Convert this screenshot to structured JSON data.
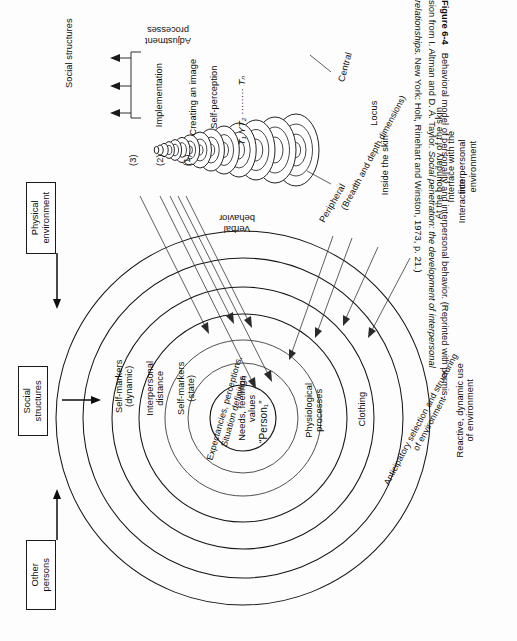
{
  "figure": {
    "number": "Figure 6-4",
    "caption_lines": [
      "Behavioral model of personality and interpersonal behavior. (Reprinted with permis-",
      "sion from I. Altman and D. A. Taylor. Social penetration: the development of interpersonal",
      "relationships. New York: Holt, Rinehart and Winston, 1973, p. 21.)"
    ],
    "caption_title": "Behavioral model of personality and interpersonal behavior.",
    "caption_source": "(Reprinted with permission from I. Altman and D. A. Taylor. Social penetration: the development of interpersonal relationships. New York: Holt, Rinehart and Winston, 1973, p. 21.)"
  },
  "env_boxes": [
    {
      "id": "physical-environment",
      "label": "Physical\nenvironment"
    },
    {
      "id": "social-structures",
      "label": "Social\nstructures"
    },
    {
      "id": "other-persons",
      "label": "Other\npersons"
    }
  ],
  "adjustment": {
    "bracket_label": "Adjustment\nprocesses",
    "bracket_label_line1": "Adjustment",
    "bracket_label_line2": "processes",
    "header": "Social structures",
    "items": [
      {
        "num": "(3)",
        "label": "Implementation"
      },
      {
        "num": "(2)",
        "label": "Creating an image"
      },
      {
        "num": "(1)",
        "label": "Self-perception"
      }
    ]
  },
  "time_axis": {
    "label": "T₁ YT₂ ········ Tₙ",
    "start": "T₁",
    "second": "YT₂",
    "dots": "·········",
    "end": "Tₙ"
  },
  "cone": {
    "axis_labels": {
      "peripheral": "Peripheral",
      "central": "Central",
      "dimension_note": "(Breadth and depth dimensions)"
    }
  },
  "locus": {
    "heading": "Locus",
    "items": [
      "Inside the skin",
      "At the boundary of the skin",
      "Interface with the interpersonal\nenvironment",
      "Interaction"
    ],
    "item_plain": [
      "Inside the skin",
      "At the boundary of the skin",
      "Interface with the interpersonal environment",
      "Interaction"
    ]
  },
  "onion": {
    "core_label": "“Person₁”",
    "top_label": "Verbal\nbehavior",
    "top_label_plain": "Verbal behavior",
    "left_layers": [
      "Self-markers\n(dynamic)",
      "Interpersonal\ndistance",
      "Self-markers\n(state)",
      "Expectancies, perceptions,\nSituation definition",
      "Needs, feelings\nvalues"
    ],
    "left_layers_plain": [
      "Self-markers (dynamic)",
      "Interpersonal distance",
      "Self-markers (state)",
      "Expectancies, perceptions, Situation definition",
      "Needs, feelings values"
    ],
    "right_layers": [
      "Physiological\nprocesses",
      "Clothing",
      "Anticipatory selection and structuring\nof environment",
      "Reactive, dynamic use\nof environment"
    ],
    "right_layers_plain": [
      "Physiological processes",
      "Clothing",
      "Anticipatory selection and structuring of environment",
      "Reactive, dynamic use of environment"
    ]
  },
  "colors": {
    "ink": "#161616",
    "paper": "#fdfdfd",
    "lead_line": "#2a2a2a"
  }
}
